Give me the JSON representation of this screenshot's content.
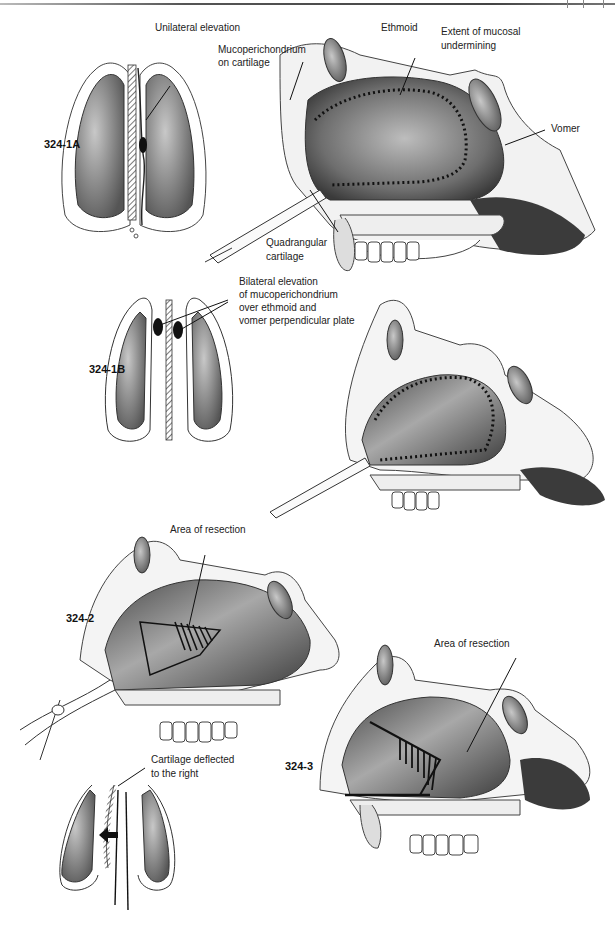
{
  "page": {
    "header_rule": true
  },
  "figures": [
    {
      "id": "324-1A",
      "labels": {
        "title": "Unilateral elevation",
        "mucoperichondrium": [
          "Mucoperichondrium",
          "on cartilage"
        ],
        "ethmoid": "Ethmoid",
        "extent": [
          "Extent of mucosal",
          "undermining"
        ],
        "vomer": "Vomer",
        "quadrangular": [
          "Quadrangular",
          "cartilage"
        ]
      }
    },
    {
      "id": "324-1B",
      "labels": {
        "bilateral": [
          "Bilateral elevation",
          "of mucoperichondrium",
          "over ethmoid and",
          "vomer perpendicular plate"
        ]
      }
    },
    {
      "id": "324-2",
      "labels": {
        "area": "Area of resection",
        "cartilage_deflected": [
          "Cartilage deflected",
          "to the right"
        ]
      }
    },
    {
      "id": "324-3",
      "labels": {
        "area": "Area of resection"
      }
    }
  ]
}
